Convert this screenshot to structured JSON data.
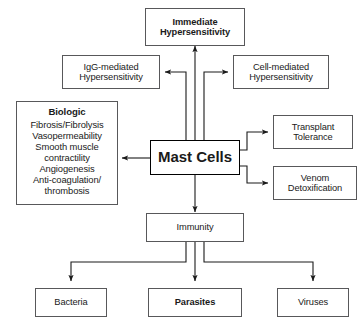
{
  "diagram": {
    "stroke_color": "#58585a",
    "text_color": "#1a1a1a",
    "background": "#ffffff"
  },
  "nodes": {
    "immediate_hypersensitivity": {
      "line1": "Immediate",
      "line2": "Hypersensitivity"
    },
    "igg_hypersensitivity": {
      "line1": "IgG-mediated",
      "line2": "Hypersensitivity"
    },
    "cell_hypersensitivity": {
      "line1": "Cell-mediated",
      "line2": "Hypersensitivity"
    },
    "biologic": {
      "heading": "Biologic",
      "items": [
        "Fibrosis/Fibrolysis",
        "Vasopermeability",
        "Smooth muscle",
        "contractility",
        "Angiogenesis",
        "Anti-coagulation/",
        "thrombosis"
      ]
    },
    "mast_cells": {
      "label": "Mast Cells"
    },
    "transplant_tolerance": {
      "line1": "Transplant",
      "line2": "Tolerance"
    },
    "venom_detoxification": {
      "line1": "Venom",
      "line2": "Detoxification"
    },
    "immunity": {
      "label": "Immunity"
    },
    "bacteria": {
      "label": "Bacteria"
    },
    "parasites": {
      "label": "Parasites"
    },
    "viruses": {
      "label": "Viruses"
    }
  }
}
